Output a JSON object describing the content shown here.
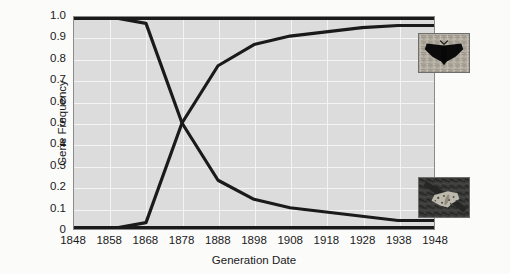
{
  "chart_data": {
    "type": "line",
    "title": "",
    "subtitle": "",
    "xlabel": "Generation Date",
    "ylabel": "Gene Frequency",
    "xlim": [
      1848,
      1948
    ],
    "ylim": [
      0,
      1.0
    ],
    "grid": true,
    "legend_position": "none",
    "x": [
      1848,
      1858,
      1868,
      1878,
      1888,
      1898,
      1908,
      1918,
      1928,
      1938,
      1948
    ],
    "xticklabels": [
      "1848",
      "1858",
      "1868",
      "1878",
      "1888",
      "1898",
      "1908",
      "1918",
      "1928",
      "1938",
      "1948"
    ],
    "yticklabels": [
      "1.0",
      "0.9",
      "0.8",
      "0.7",
      "0.6",
      "0.5",
      "0.4",
      "0.3",
      "0.2",
      "0.1",
      "0"
    ],
    "ytickvalues": [
      1.0,
      0.9,
      0.8,
      0.7,
      0.6,
      0.5,
      0.4,
      0.3,
      0.2,
      0.1,
      0
    ],
    "series": [
      {
        "name": "melanic-form-rising",
        "color": "#1a1a1a",
        "values": [
          0.0,
          0.0,
          0.03,
          0.5,
          0.77,
          0.87,
          0.91,
          0.93,
          0.95,
          0.96,
          0.96
        ]
      },
      {
        "name": "typical-form-falling",
        "color": "#1a1a1a",
        "values": [
          1.0,
          1.0,
          0.97,
          0.5,
          0.23,
          0.14,
          0.1,
          0.08,
          0.06,
          0.04,
          0.04
        ]
      }
    ],
    "annotations": [
      {
        "name": "dark-moth-photo",
        "description": "dark melanic peppered moth on pale lichen-covered bark",
        "position": "upper-right"
      },
      {
        "name": "light-moth-photo",
        "description": "pale speckled peppered moth on dark soot-covered bark",
        "position": "lower-right"
      }
    ]
  },
  "colors": {
    "plot_background": "#dcdcdc",
    "page_background": "#fbfbfa",
    "gridline": "#f4f4f4",
    "line": "#1a1a1a",
    "axis": "#1a1a1a"
  }
}
